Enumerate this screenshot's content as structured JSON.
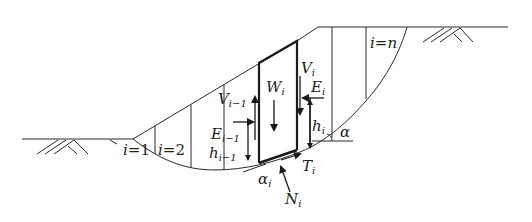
{
  "figure": {
    "type": "slope stability slice method diagram",
    "colors": {
      "line": "#2a2a2a",
      "background": "#ffffff"
    },
    "labels": {
      "slice_first": {
        "var": "i",
        "eq": "=",
        "val": "1"
      },
      "slice_second": {
        "var": "i",
        "eq": "=",
        "val": "2"
      },
      "slice_last": {
        "var": "i",
        "eq": "=",
        "val": "n"
      },
      "weight": {
        "main": "W",
        "sub": "i"
      },
      "shear_left": {
        "main": "V",
        "sub": "i−1"
      },
      "normal_left": {
        "main": "E",
        "sub": "i−1"
      },
      "height_left": {
        "main": "h",
        "sub": "i−1"
      },
      "shear_right": {
        "main": "V",
        "sub": "i"
      },
      "normal_right": {
        "main": "E",
        "sub": "i"
      },
      "height_right": {
        "main": "h",
        "sub": "i"
      },
      "base_shear": {
        "main": "T",
        "sub": "i"
      },
      "base_normal": {
        "main": "N",
        "sub": "i"
      },
      "base_angle": {
        "main": "α",
        "sub": "i"
      },
      "slope_angle": {
        "main": "α"
      }
    },
    "icons": [
      "ground-hatch-left",
      "ground-hatch-right"
    ]
  }
}
